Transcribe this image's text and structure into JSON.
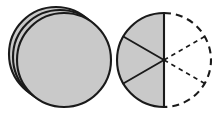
{
  "figure": {
    "title": "Stack of three discs beside a circle divided into six equal sectors",
    "canvas": {
      "width": 215,
      "height": 116,
      "background": "#ffffff"
    },
    "style": {
      "fill_gray": "#c9c9c9",
      "outline_color": "#1a1a1a",
      "outline_width": 2.1,
      "divider_width": 1.9,
      "dashed_outline_width": 2.1,
      "dashed_outline_pattern": "7 5",
      "dashed_divider_width": 1.6,
      "dashed_divider_pattern": "4.5 4"
    },
    "left_group": {
      "name": "disc-stack",
      "description": "Three identical gray discs stacked with a small offset so three rims are visible on the upper-left",
      "disc_count": 3,
      "radius": 47,
      "discs": [
        {
          "label": "back-disc",
          "cx": 56,
          "cy": 54
        },
        {
          "label": "middle-disc",
          "cx": 60,
          "cy": 57
        },
        {
          "label": "front-disc",
          "cx": 64,
          "cy": 60
        }
      ]
    },
    "right_group": {
      "name": "sector-circle",
      "description": "Circle split vertically; the left half is shaded and drawn solid and is cut into three equal sectors, the right half is drawn with dashed lines and is also cut into three equal sectors",
      "cx": 164,
      "cy": 60,
      "radius": 47,
      "total_sectors": 6,
      "sector_angle_degrees": 60,
      "shaded_sectors": 3,
      "dashed_sectors": 3,
      "fraction_shaded": "3/6",
      "solid_half": {
        "label": "shaded-left-half",
        "start_angle_degrees": 90,
        "end_angle_degrees": 270,
        "divider_angles_degrees": [
          150,
          210
        ]
      },
      "dashed_half": {
        "label": "dashed-right-half",
        "start_angle_degrees": -90,
        "end_angle_degrees": 90,
        "divider_angles_degrees": [
          -30,
          30
        ]
      },
      "diameter_line": {
        "label": "vertical-diameter",
        "x": 164,
        "y_top": 13,
        "y_bottom": 107
      }
    }
  }
}
